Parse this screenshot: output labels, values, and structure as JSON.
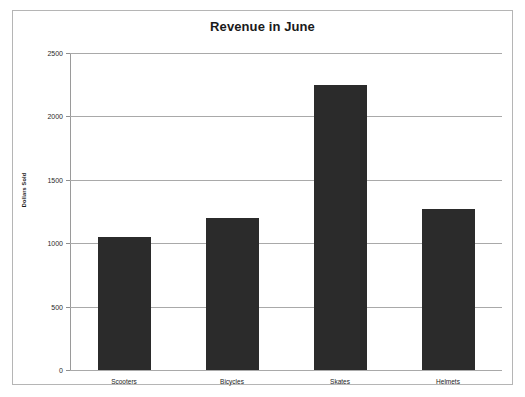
{
  "chart_data": {
    "type": "bar",
    "title": "Revenue in June",
    "xlabel": "",
    "ylabel": "Dollars Sold",
    "categories": [
      "Scooters",
      "Bicycles",
      "Skates",
      "Helmets"
    ],
    "values": [
      1050,
      1200,
      2250,
      1270
    ],
    "ylim": [
      0,
      2500
    ],
    "yticks": [
      0,
      500,
      1000,
      1500,
      2000,
      2500
    ],
    "ytick_labels": [
      "0",
      "500",
      "1000",
      "1500",
      "2000",
      "2500"
    ],
    "grid": true,
    "legend": false,
    "bar_color": "#2b2b2b",
    "gridline_color": "#a9a9a9",
    "axis_color": "#8f8f8f",
    "background_color": "#ffffff",
    "frame_color": "#b5b5b5",
    "text_color": "#1a1a1a"
  }
}
